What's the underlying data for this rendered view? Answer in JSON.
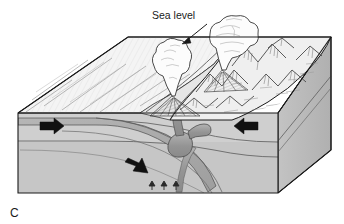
{
  "figure": {
    "panel_label": "C",
    "labels": [
      {
        "id": "sea-level",
        "text": "Sea level"
      }
    ],
    "diagram_type": "geologic block diagram"
  },
  "annotations": {
    "sea_level": {
      "text": "Sea level",
      "leader": "arrow pointing down-left to the ocean surface"
    }
  },
  "motion_arrows": [
    {
      "id": "plate-left-arrow",
      "direction": "right",
      "meaning": "left plate moves right"
    },
    {
      "id": "plate-right-arrow",
      "direction": "left",
      "meaning": "right plate moves left"
    },
    {
      "id": "slab-descent-arrow",
      "direction": "down-right",
      "meaning": "subducting slab descends"
    },
    {
      "id": "magma-rise-arrow-1",
      "direction": "up",
      "meaning": "magma generation"
    },
    {
      "id": "magma-rise-arrow-2",
      "direction": "up",
      "meaning": "magma generation"
    },
    {
      "id": "magma-rise-arrow-3",
      "direction": "up",
      "meaning": "magma generation"
    }
  ],
  "features": [
    {
      "id": "ocean-floor",
      "name": "oceanic plate surface"
    },
    {
      "id": "volcanic-arc",
      "name": "volcanic arc mountains"
    },
    {
      "id": "eruption-plume-left",
      "name": "eruption plume"
    },
    {
      "id": "eruption-plume-right",
      "name": "eruption plume"
    },
    {
      "id": "magma-conduit",
      "name": "magma conduit"
    },
    {
      "id": "magma-chamber",
      "name": "magma chamber"
    },
    {
      "id": "subducting-slab",
      "name": "subducting slab"
    }
  ],
  "colors": {
    "background": "#ffffff",
    "outline": "#1a1a1a",
    "ocean_top": "#f2f2f2",
    "arc_top": "#ececec",
    "crust_band": "#d9d9d9",
    "lithosphere": "#cfcfcf",
    "mantle": "#c6c6c6",
    "side_face": "#bdbdbd",
    "side_face_dark": "#b2b2b2",
    "slab": "#a8a8a8",
    "magma": "#9a9a9a",
    "plume": "#fbfbfb",
    "arrow": "#111111",
    "hatch": "#7d7d7d"
  }
}
